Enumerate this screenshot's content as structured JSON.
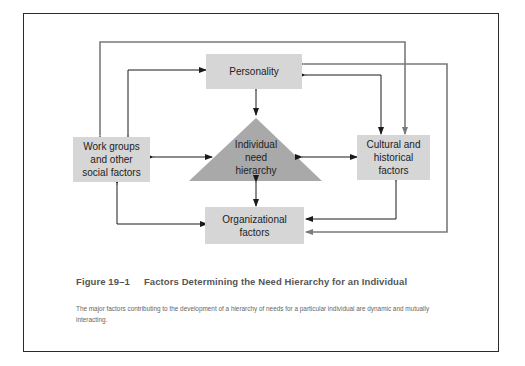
{
  "figure": {
    "number": "Figure 19–1",
    "title": "Factors Determining the Need Hierarchy for an Individual",
    "caption": "The major factors contributing to the development of a hierarchy of needs for a particular individual are dynamic and mutually interacting."
  },
  "nodes": {
    "personality": {
      "label": "Personality"
    },
    "work_groups": {
      "label": "Work groups\nand other\nsocial factors"
    },
    "cultural": {
      "label": "Cultural and\nhistorical\nfactors"
    },
    "organizational": {
      "label": "Organizational\nfactors"
    },
    "center": {
      "label": "Individual\nneed\nhierarchy",
      "shape": "triangle"
    }
  },
  "edges": [
    {
      "from": "personality",
      "to": "center",
      "style": "black",
      "direction": "both"
    },
    {
      "from": "center",
      "to": "organizational",
      "style": "black",
      "direction": "both"
    },
    {
      "from": "work_groups",
      "to": "center",
      "style": "black",
      "direction": "both"
    },
    {
      "from": "center",
      "to": "cultural",
      "style": "black",
      "direction": "both"
    },
    {
      "from": "work_groups",
      "to": "personality",
      "style": "black",
      "direction": "both"
    },
    {
      "from": "personality",
      "to": "cultural",
      "style": "black",
      "direction": "both"
    },
    {
      "from": "work_groups",
      "to": "organizational",
      "style": "black",
      "direction": "both"
    },
    {
      "from": "cultural",
      "to": "organizational",
      "style": "black",
      "direction": "both"
    },
    {
      "from": "work_groups",
      "to": "cultural",
      "style": "grey",
      "direction": "both"
    },
    {
      "from": "personality",
      "to": "organizational",
      "style": "grey",
      "direction": "both"
    }
  ],
  "colors": {
    "box_fill": "#d6d6d6",
    "triangle_fill": "#a9a9a9",
    "black_line": "#1a1a1a",
    "grey_line": "#7a7a7a"
  }
}
